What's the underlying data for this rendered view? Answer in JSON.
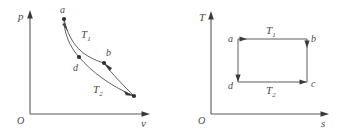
{
  "figure": {
    "title": "",
    "panels": [
      {
        "id": "pv-diagram",
        "axes": {
          "y_label": "p",
          "x_label": "v",
          "origin_label": "O"
        },
        "isotherm_labels": {
          "upper": "T",
          "upper_sub": "1",
          "lower": "T",
          "lower_sub": "2"
        },
        "point_labels": {
          "a": "a",
          "b": "b",
          "d": "d"
        }
      },
      {
        "id": "ts-diagram",
        "axes": {
          "y_label": "T",
          "x_label": "s",
          "origin_label": "O"
        },
        "isotherm_labels": {
          "upper": "T",
          "upper_sub": "1",
          "lower": "T",
          "lower_sub": "2"
        },
        "point_labels": {
          "a": "a",
          "b": "b",
          "c": "c",
          "d": "d"
        }
      }
    ]
  },
  "colors": {
    "stroke": "#5a5a5a",
    "curve": "#4f4f4f",
    "text": "#4a4a4a",
    "dot": "#2e2e2e",
    "background": "#ffffff"
  }
}
